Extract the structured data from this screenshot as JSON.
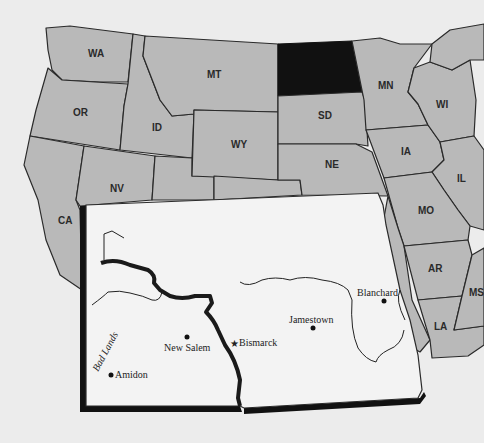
{
  "map": {
    "title": "United States with North Dakota inset",
    "highlighted_state": "ND",
    "colors": {
      "background": "#ececec",
      "state_fill": "#b9b9b9",
      "highlight_fill": "#111111",
      "inset_fill": "#f3f3f3",
      "border": "#2a2a2a"
    },
    "state_labels": {
      "wa": "WA",
      "or": "OR",
      "ca": "CA",
      "id": "ID",
      "nv": "NV",
      "mt": "MT",
      "wy": "WY",
      "sd": "SD",
      "ne": "NE",
      "mn": "MN",
      "ia": "IA",
      "wi": "WI",
      "il": "IL",
      "mo": "MO",
      "ar": "AR",
      "la": "LA",
      "ms": "MS"
    },
    "inset": {
      "state": "North Dakota",
      "cities": {
        "bismarck": "Bismarck",
        "new_salem": "New Salem",
        "amidon": "Amidon",
        "jamestown": "Jamestown",
        "blanchard": "Blanchard"
      },
      "region_label": "Bad Lands",
      "capital_marker": "★"
    }
  }
}
